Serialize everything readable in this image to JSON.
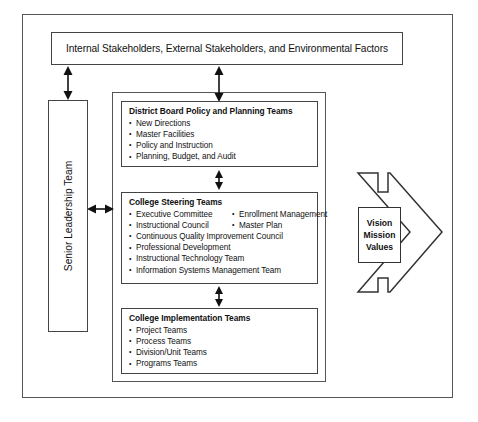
{
  "diagram": {
    "banner": {
      "label": "Internal Stakeholders, External Stakeholders, and Environmental Factors"
    },
    "senior_leadership": {
      "label": "Senior Leadership Team"
    },
    "boxes": [
      {
        "id": "district-board",
        "title": "District Board Policy and Planning Teams",
        "items": [
          "New Directions",
          "Master Facilities",
          "Policy and Instruction",
          "Planning, Budget, and Audit"
        ]
      },
      {
        "id": "college-steering",
        "title": "College Steering Teams",
        "items_col_a": [
          "Executive Committee",
          "Instructional Council"
        ],
        "items_col_b": [
          "Enrollment Management",
          "Master Plan"
        ],
        "items_full": [
          "Continuous Quality Improvement Council",
          "Professional Development",
          "Instructional Technology Team",
          "Information Systems Management Team"
        ]
      },
      {
        "id": "college-implementation",
        "title": "College Implementation Teams",
        "items": [
          "Project Teams",
          "Process Teams",
          "Division/Unit Teams",
          "Programs Teams"
        ]
      }
    ],
    "outcome_arrow": {
      "lines": [
        "Vision",
        "Mission",
        "Values"
      ],
      "direction": "right"
    },
    "connectors": [
      {
        "name": "banner-to-senior-leadership",
        "style": "double-headed-vertical"
      },
      {
        "name": "banner-to-district-board",
        "style": "double-headed-vertical"
      },
      {
        "name": "district-board-to-steering",
        "style": "double-headed-vertical"
      },
      {
        "name": "steering-to-implementation",
        "style": "double-headed-vertical"
      },
      {
        "name": "senior-leadership-to-steering",
        "style": "double-headed-horizontal"
      }
    ],
    "colors": {
      "line": "#333333",
      "frame": "#555555",
      "text": "#111111",
      "background": "#ffffff"
    }
  }
}
